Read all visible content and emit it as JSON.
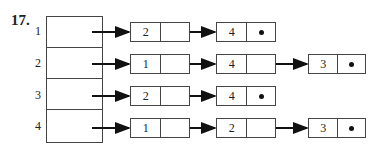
{
  "problem": {
    "number": "17."
  },
  "array": {
    "labels": [
      "1",
      "2",
      "3",
      "4"
    ]
  },
  "lists": [
    {
      "index": "1",
      "nodes": [
        {
          "value": "2",
          "null_next": false
        },
        {
          "value": "4",
          "null_next": true
        }
      ]
    },
    {
      "index": "2",
      "nodes": [
        {
          "value": "1",
          "null_next": false
        },
        {
          "value": "4",
          "null_next": false
        },
        {
          "value": "3",
          "null_next": true
        }
      ]
    },
    {
      "index": "3",
      "nodes": [
        {
          "value": "2",
          "null_next": false
        },
        {
          "value": "4",
          "null_next": true
        }
      ]
    },
    {
      "index": "4",
      "nodes": [
        {
          "value": "1",
          "null_next": false
        },
        {
          "value": "2",
          "null_next": false
        },
        {
          "value": "3",
          "null_next": true
        }
      ]
    }
  ],
  "colors": {
    "line": "#444444",
    "arrow": "#111111"
  }
}
